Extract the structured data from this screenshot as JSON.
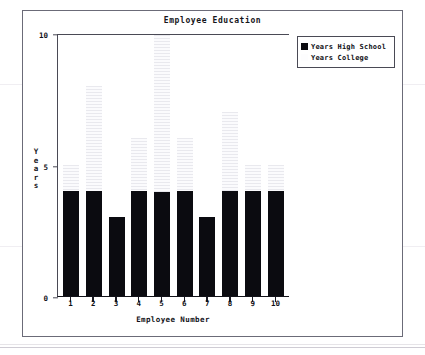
{
  "chart_data": {
    "type": "bar",
    "title": "Employee Education",
    "xlabel": "Employee Number",
    "ylabel": "Years",
    "categories": [
      "1",
      "2",
      "3",
      "4",
      "5",
      "6",
      "7",
      "8",
      "9",
      "10"
    ],
    "series": [
      {
        "name": "Years High School",
        "color": "#0b0b10",
        "values": [
          4,
          4,
          3,
          4,
          4,
          4,
          3,
          4,
          4,
          4
        ]
      },
      {
        "name": "Years College",
        "color": "#fdfdfe",
        "values": [
          1,
          4,
          0,
          2,
          6,
          2,
          0,
          3,
          1,
          1
        ]
      }
    ],
    "stacked": true,
    "totals": [
      5,
      8,
      3,
      6,
      10,
      6,
      3,
      7,
      5,
      5
    ],
    "ylim": [
      0,
      10
    ],
    "yticks": [
      "0",
      "5",
      "10"
    ],
    "ytick_values": [
      0,
      5,
      10
    ],
    "grid": false,
    "legend_position": "top-right",
    "legend": [
      "Years High School",
      "Years College"
    ]
  },
  "ylabel_chars": [
    "Y",
    "e",
    "a",
    "r",
    "s"
  ]
}
